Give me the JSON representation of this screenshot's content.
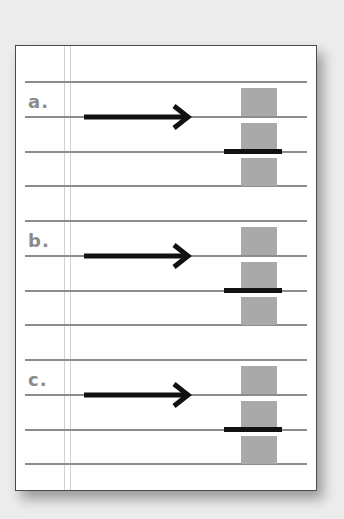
{
  "sections": [
    {
      "label": "a.",
      "top": 35
    },
    {
      "label": "b.",
      "top": 174
    },
    {
      "label": "c.",
      "top": 313
    }
  ],
  "colors": {
    "rule": "#8c8c8c",
    "block": "#a9a9a9",
    "arrow": "#111111",
    "label": "#8a8a8a"
  }
}
